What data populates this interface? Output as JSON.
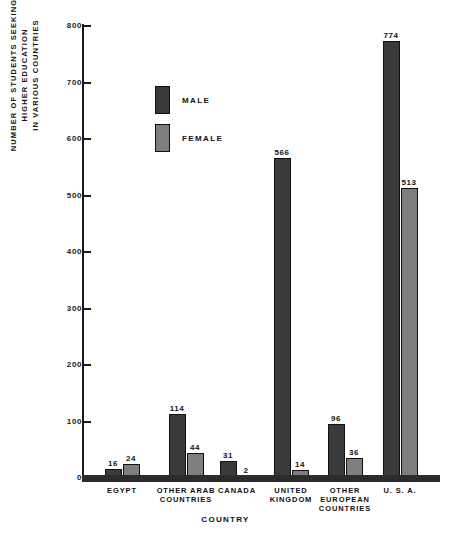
{
  "chart_data": {
    "type": "bar",
    "title": "",
    "xlabel": "COUNTRY",
    "ylabel": "NUMBER OF STUDENTS SEEKING HIGHER EDUCATION\nIN VARIOUS COUNTRIES",
    "categories": [
      "EGYPT",
      "OTHER ARAB\nCOUNTRIES",
      "CANADA",
      "UNITED\nKINGDOM",
      "OTHER\nEUROPEAN\nCOUNTRIES",
      "U. S. A."
    ],
    "series": [
      {
        "name": "MALE",
        "color": "#3a3a3a",
        "values": [
          16,
          114,
          31,
          566,
          96,
          774
        ]
      },
      {
        "name": "FEMALE",
        "color": "#7e7e7e",
        "values": [
          24,
          44,
          2,
          14,
          36,
          513
        ]
      }
    ],
    "ylim": [
      0,
      800
    ],
    "yticks": [
      0,
      100,
      200,
      300,
      400,
      500,
      600,
      700,
      800
    ],
    "ytick_labels": [
      "0",
      "100",
      "200",
      "300",
      "400",
      "500",
      "600",
      "700",
      "800"
    ],
    "grid": false,
    "legend_position": "upper-left-inside"
  },
  "legend": {
    "entries": [
      {
        "label": "MALE",
        "swatch": "male"
      },
      {
        "label": "FEMALE",
        "swatch": "female"
      }
    ]
  }
}
